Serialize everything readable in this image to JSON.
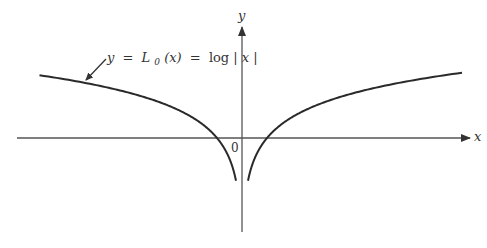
{
  "chart_data": {
    "type": "line",
    "title": "",
    "function": "log|x|",
    "annotation": {
      "y": "y",
      "eq1": "=",
      "L": "L",
      "sub": "0",
      "arg": "(x)",
      "eq2": "=",
      "rhs_prefix": "log",
      "rhs_abs_open": "|",
      "rhs_var": "x",
      "rhs_abs_close": "|"
    },
    "xlabel": "x",
    "ylabel": "y",
    "origin_label": "0",
    "grid": false,
    "legend": "none",
    "xlim": [
      -8.1,
      8.8
    ],
    "ylim": [
      -2.3,
      2.2
    ],
    "asymptote_x": 0,
    "zeros": [
      -1,
      1
    ],
    "series": [
      {
        "name": "left branch (x<0)",
        "x": [
          -8.1,
          -6,
          -4,
          -3,
          -2,
          -1.5,
          -1,
          -0.7,
          -0.5,
          -0.3,
          -0.2,
          -0.1
        ],
        "y": [
          2.09,
          1.79,
          1.39,
          1.1,
          0.69,
          0.41,
          0.0,
          -0.36,
          -0.69,
          -1.2,
          -1.61,
          -2.3
        ]
      },
      {
        "name": "right branch (x>0)",
        "x": [
          0.1,
          0.2,
          0.3,
          0.5,
          0.7,
          1,
          1.5,
          2,
          3,
          4,
          6,
          8.8
        ],
        "y": [
          -2.3,
          -1.61,
          -1.2,
          -0.69,
          -0.36,
          0.0,
          0.41,
          0.69,
          1.1,
          1.39,
          1.79,
          2.17
        ]
      }
    ],
    "colors": {
      "curve": "#2a2a2a",
      "axis": "#555555",
      "text": "#333333"
    }
  }
}
